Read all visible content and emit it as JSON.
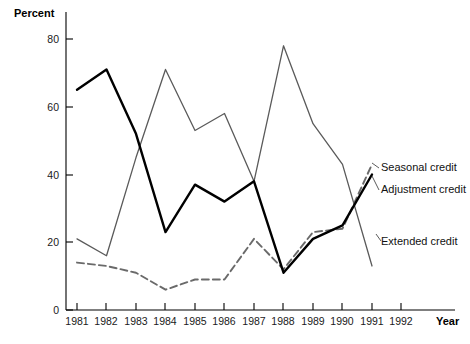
{
  "chart_data": {
    "type": "line",
    "title": "",
    "xlabel": "Year",
    "ylabel": "Percent",
    "grid": false,
    "legend_position": "right-inline-labels",
    "xlim": [
      1981,
      1992
    ],
    "ylim": [
      0,
      80
    ],
    "yticks": [
      0,
      20,
      40,
      60,
      80
    ],
    "ytick_labels": [
      "0",
      "20",
      "40",
      "60",
      "80"
    ],
    "xticks": [
      1981,
      1982,
      1983,
      1984,
      1985,
      1986,
      1987,
      1988,
      1989,
      1990,
      1991,
      1992
    ],
    "xtick_labels": [
      "1981",
      "1982",
      "1983",
      "1984",
      "1985",
      "1986",
      "1987",
      "1988",
      "1989",
      "1990",
      "1991",
      "1992"
    ],
    "x": [
      1981,
      1982,
      1983,
      1984,
      1985,
      1986,
      1987,
      1988,
      1989,
      1990,
      1991
    ],
    "series": [
      {
        "name": "Adjustment credit",
        "style": "solid-thick",
        "color": "#000000",
        "values": [
          65,
          71,
          52,
          23,
          37,
          32,
          38,
          11,
          21,
          25,
          40
        ]
      },
      {
        "name": "Extended credit",
        "style": "solid-thin",
        "color": "#5a5a5a",
        "values": [
          21,
          16,
          45,
          71,
          53,
          58,
          38,
          78,
          55,
          43,
          13
        ]
      },
      {
        "name": "Seasonal credit",
        "style": "dashed",
        "color": "#6a6a6a",
        "values": [
          14,
          13,
          11,
          6,
          9,
          9,
          21,
          12,
          23,
          24,
          43
        ]
      }
    ],
    "annotations": [
      {
        "text": "Seasonal credit",
        "x": 1991.6,
        "y": 46
      },
      {
        "text": "Adjustment credit",
        "x": 1991.6,
        "y": 39
      },
      {
        "text": "Extended credit",
        "x": 1991.6,
        "y": 22
      }
    ]
  },
  "axes": {
    "y_title": "Percent",
    "x_title": "Year"
  },
  "labels": {
    "seasonal": "Seasonal credit",
    "adjustment": "Adjustment credit",
    "extended": "Extended credit"
  },
  "caption": {
    "text": ""
  }
}
